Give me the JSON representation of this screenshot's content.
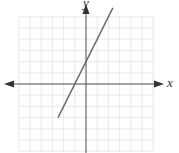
{
  "chart_data": {
    "type": "line",
    "title": "",
    "xlabel": "x",
    "ylabel": "y",
    "grid": true,
    "xlim": [
      -6,
      6
    ],
    "ylim": [
      -6,
      6
    ],
    "series": [
      {
        "name": "y = 2x + 2",
        "slope": 2,
        "intercept": 2,
        "x": [
          -2.5,
          2.4
        ],
        "y": [
          -3,
          6.8
        ]
      }
    ],
    "colors": {
      "grid": "#e2e2e2",
      "axis": "#555555",
      "line": "#666666"
    }
  },
  "labels": {
    "x_axis": "x",
    "y_axis": "y"
  }
}
